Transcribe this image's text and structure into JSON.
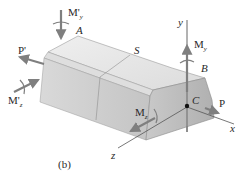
{
  "figure": {
    "caption": "(b)",
    "points": {
      "A": "A",
      "B": "B",
      "C": "C",
      "S": "S"
    },
    "axes": {
      "x": "x",
      "y": "y",
      "z": "z"
    },
    "loads": {
      "P_right": "P",
      "P_left": "P'",
      "My_right": {
        "main": "M",
        "sub": "y"
      },
      "Mz_right": {
        "main": "M",
        "sub": "z"
      },
      "My_left": {
        "main": "M'",
        "sub": "y"
      },
      "Mz_left": {
        "main": "M'",
        "sub": "z"
      }
    },
    "colors": {
      "arrow": "#7f7f7f",
      "axis": "#555555",
      "body_top": "#e6e6e6",
      "body_front": "#d0d0d0",
      "body_end": "#bdbdbd",
      "edge": "#8a8a8a"
    }
  }
}
